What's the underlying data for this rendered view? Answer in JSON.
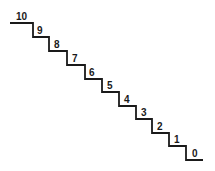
{
  "diagram": {
    "type": "staircase",
    "line_color": "#1a1a1a",
    "steps": [
      {
        "label": "10"
      },
      {
        "label": "9"
      },
      {
        "label": "8"
      },
      {
        "label": "7"
      },
      {
        "label": "6"
      },
      {
        "label": "5"
      },
      {
        "label": "4"
      },
      {
        "label": "3"
      },
      {
        "label": "2"
      },
      {
        "label": "1"
      },
      {
        "label": "0"
      }
    ]
  }
}
